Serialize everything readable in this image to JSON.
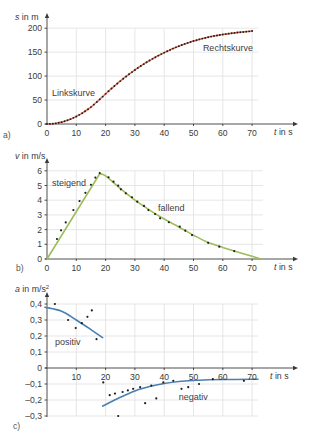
{
  "colors": {
    "grid": "#e3e3e3",
    "axis": "#3a3a3a",
    "marker": "#1e1e1e",
    "curve_a": "#e2735a",
    "curve_b": "#9cbd5a",
    "curve_c": "#4b7fb0"
  },
  "chart_data": [
    {
      "panel_label": "a)",
      "type": "line",
      "title": "",
      "xlabel": "t in s",
      "xlabel_var": "t",
      "xlabel_unit": " in s",
      "ylabel": "s in m",
      "ylabel_var": "s",
      "ylabel_unit": " in m",
      "ylabel_sup": "",
      "xlim": [
        0,
        70
      ],
      "ylim": [
        0,
        200
      ],
      "grid": true,
      "xticks": [
        0,
        10,
        20,
        30,
        40,
        50,
        60,
        70
      ],
      "xtick_labels": [
        "0",
        "10",
        "20",
        "30",
        "40",
        "50",
        "60",
        "70"
      ],
      "yticks": [
        0,
        50,
        100,
        150,
        200
      ],
      "ytick_labels": [
        "0",
        "50",
        "100",
        "150",
        "200"
      ],
      "series": [
        {
          "name": "s(t)",
          "color_key": "curve_a",
          "markers": true,
          "x": [
            0,
            1,
            2,
            3,
            4,
            5,
            6,
            7,
            8,
            9,
            10,
            11,
            12,
            13,
            14,
            15,
            16,
            17,
            18,
            19,
            20,
            21,
            22,
            23,
            24,
            25,
            26,
            27,
            28,
            29,
            30,
            31,
            32,
            33,
            34,
            35,
            36,
            37,
            38,
            39,
            40,
            41,
            42,
            43,
            44,
            45,
            46,
            47,
            48,
            49,
            50,
            51,
            52,
            53,
            54,
            55,
            56,
            57,
            58,
            59,
            60,
            61,
            62,
            63,
            64,
            65,
            66,
            67,
            68,
            69,
            70
          ],
          "y": [
            0,
            0.2,
            0.6,
            1.4,
            2.5,
            3.9,
            5.6,
            7.7,
            10.1,
            12.8,
            15.8,
            19.1,
            22.7,
            26.6,
            30.8,
            35.3,
            40.5,
            45.9,
            51.5,
            57.2,
            62.9,
            68.5,
            74.0,
            79.3,
            84.5,
            89.6,
            94.5,
            99.3,
            103.9,
            108.4,
            112.8,
            117.0,
            121.1,
            125.0,
            128.8,
            132.5,
            136.0,
            139.4,
            142.7,
            145.9,
            149.0,
            151.9,
            154.7,
            157.4,
            160.0,
            162.5,
            164.9,
            167.2,
            169.3,
            171.3,
            173.2,
            175.0,
            176.7,
            178.3,
            179.8,
            181.2,
            182.5,
            183.7,
            184.8,
            185.8,
            186.8,
            187.7,
            188.6,
            189.4,
            190.2,
            190.9,
            191.6,
            192.2,
            192.8,
            193.4,
            194.0
          ]
        }
      ],
      "annotations": [
        {
          "text": "Linkskurve",
          "x": 1.7,
          "y": 58
        },
        {
          "text": "Rechtskurve",
          "x": 53.2,
          "y": 152
        }
      ]
    },
    {
      "panel_label": "b)",
      "type": "scatter",
      "title": "",
      "xlabel": "t in s",
      "xlabel_var": "t",
      "xlabel_unit": " in s",
      "ylabel": "v in m/s",
      "ylabel_var": "v",
      "ylabel_unit": " in m/s",
      "ylabel_sup": "",
      "xlim": [
        0,
        70
      ],
      "ylim": [
        0,
        6
      ],
      "grid": true,
      "xticks": [
        0,
        10,
        20,
        30,
        40,
        50,
        60,
        70
      ],
      "xtick_labels": [
        "0",
        "10",
        "20",
        "30",
        "40",
        "50",
        "60",
        "70"
      ],
      "yticks": [
        0,
        1,
        2,
        3,
        4,
        5,
        6
      ],
      "ytick_labels": [
        "0",
        "1",
        "2",
        "3",
        "4",
        "5",
        "6"
      ],
      "points": {
        "name": "measured v",
        "x": [
          3.4,
          4.8,
          6.4,
          9.0,
          11.1,
          13.1,
          15.0,
          16.5,
          18.0,
          21.0,
          22.7,
          24.3,
          25.2,
          26.9,
          29.0,
          30.8,
          33.1,
          34.6,
          36.9,
          38.6,
          41.6,
          45.3,
          47.2,
          49.5,
          55.0,
          58.8,
          63.9
        ],
        "y": [
          1.36,
          1.95,
          2.49,
          3.33,
          3.94,
          4.5,
          5.05,
          5.54,
          5.85,
          5.56,
          5.26,
          4.99,
          4.74,
          4.47,
          4.2,
          3.9,
          3.61,
          3.33,
          3.06,
          2.77,
          2.5,
          2.2,
          1.93,
          1.63,
          1.1,
          0.84,
          0.54
        ]
      },
      "curves": [
        {
          "name": "steigend",
          "color_key": "curve_b",
          "x": [
            0,
            18
          ],
          "y": [
            0,
            5.8
          ]
        },
        {
          "name": "fallend",
          "color_key": "curve_b",
          "x": [
            18,
            20,
            25,
            30,
            35,
            40,
            45,
            50,
            55,
            60,
            65,
            70,
            73
          ],
          "y": [
            5.8,
            5.65,
            4.8,
            4.0,
            3.33,
            2.72,
            2.18,
            1.62,
            1.12,
            0.79,
            0.48,
            0.18,
            0
          ]
        }
      ],
      "annotations": [
        {
          "text": "steigend",
          "x": 1.7,
          "y": 4.97
        },
        {
          "text": "fallend",
          "x": 37.9,
          "y": 3.27
        }
      ]
    },
    {
      "panel_label": "c)",
      "type": "scatter",
      "title": "",
      "xlabel": "t in s",
      "xlabel_var": "t",
      "xlabel_unit": " in s",
      "ylabel": "a in m/s²",
      "ylabel_var": "a",
      "ylabel_unit": " in m/s",
      "ylabel_sup": "2",
      "xlim": [
        0,
        70
      ],
      "ylim": [
        -0.3,
        0.4
      ],
      "grid": true,
      "xticks": [
        10,
        20,
        30,
        40,
        50,
        60,
        70
      ],
      "xtick_labels": [
        "10",
        "20",
        "30",
        "40",
        "50",
        "60",
        "70"
      ],
      "yticks": [
        0.4,
        0.3,
        0.2,
        0.1,
        0,
        -0.1,
        -0.2,
        -0.3
      ],
      "ytick_labels": [
        "0,4",
        "0,3",
        "0,2",
        "0,1",
        "0",
        "–0,1",
        "–0,2",
        "–0,3"
      ],
      "points": {
        "name": "measured a",
        "x": [
          2.7,
          7.2,
          9.8,
          11.9,
          13.8,
          15.3,
          16.9,
          19.2,
          21.4,
          23.2,
          24.3,
          25.8,
          27.6,
          29.4,
          31.8,
          33.5,
          35.6,
          37.3,
          39.7,
          43.1,
          45.9,
          48.2,
          51.9,
          56.6,
          67.2
        ],
        "y": [
          0.4,
          0.3,
          0.25,
          0.28,
          0.32,
          0.36,
          0.18,
          -0.09,
          -0.17,
          -0.16,
          -0.3,
          -0.15,
          -0.14,
          -0.13,
          -0.12,
          -0.22,
          -0.11,
          -0.19,
          -0.09,
          -0.08,
          -0.13,
          -0.12,
          -0.1,
          -0.07,
          -0.08
        ]
      },
      "curves": [
        {
          "name": "positiv",
          "color_key": "curve_c",
          "x": [
            -0.7,
            5,
            10,
            15,
            19
          ],
          "y": [
            0.38,
            0.355,
            0.3,
            0.24,
            0.19
          ]
        },
        {
          "name": "negativ",
          "color_key": "curve_c",
          "x": [
            19,
            25,
            30,
            35,
            40,
            45,
            50,
            60,
            72
          ],
          "y": [
            -0.238,
            -0.183,
            -0.143,
            -0.116,
            -0.097,
            -0.084,
            -0.078,
            -0.072,
            -0.07
          ]
        }
      ],
      "annotations": [
        {
          "text": "positiv",
          "x": 2.7,
          "y": 0.144
        },
        {
          "text": "negativ",
          "x": 45,
          "y": -0.2
        }
      ]
    }
  ]
}
